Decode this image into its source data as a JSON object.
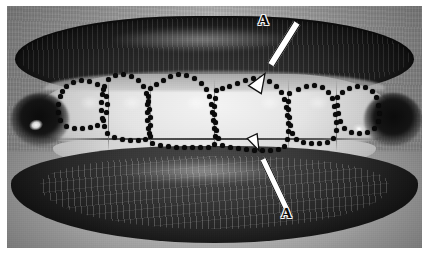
{
  "figure": {
    "kind": "clinical-photograph",
    "modality": "black-and-white intraoral smile photograph",
    "width_px": 429,
    "height_px": 260,
    "border_color": "#ffffff",
    "ink_color": "#0a0a0a"
  },
  "annotations": {
    "labels": [
      {
        "id": "label-a-upper",
        "text": "A",
        "x": 258,
        "y": 13,
        "description": "upper label A"
      },
      {
        "id": "label-a-lower",
        "text": "A",
        "x": 281,
        "y": 206,
        "description": "lower label A"
      }
    ],
    "arrows": [
      {
        "id": "arrow-upper",
        "style": "hollow-outline",
        "from_x": 297,
        "from_y": 22,
        "to_x": 265,
        "to_y": 73,
        "points_to": "incisal/cervical outline of maxillary right central incisor region",
        "direction": "down-left"
      },
      {
        "id": "arrow-lower",
        "style": "hollow-outline",
        "from_x": 286,
        "from_y": 207,
        "to_x": 259,
        "to_y": 150,
        "points_to": "incisal edge of maxillary left central incisor outline",
        "direction": "up-left"
      }
    ],
    "dotted_outlines": {
      "description": "Dotted black outlines tracing the clinical crown contours of six maxillary anterior teeth",
      "dot_color": "#0a0a0a",
      "dot_diameter_px": 5,
      "dot_spacing_px": 8,
      "teeth_outlined": 6,
      "paths": [
        {
          "name": "tooth-outline-1",
          "tooth": "maxillary right canine",
          "points": [
            [
              60,
              96
            ],
            [
              58,
              104
            ],
            [
              58,
              112
            ],
            [
              60,
              120
            ],
            [
              66,
              126
            ],
            [
              74,
              128
            ],
            [
              82,
              128
            ],
            [
              90,
              127
            ],
            [
              97,
              125
            ],
            [
              103,
              120
            ],
            [
              106,
              112
            ],
            [
              107,
              104
            ],
            [
              106,
              96
            ],
            [
              103,
              89
            ],
            [
              97,
              84
            ],
            [
              89,
              81
            ],
            [
              81,
              80
            ],
            [
              73,
              82
            ],
            [
              66,
              86
            ],
            [
              62,
              91
            ]
          ]
        },
        {
          "name": "tooth-outline-2",
          "tooth": "maxillary right lateral incisor",
          "points": [
            [
              104,
              86
            ],
            [
              102,
              94
            ],
            [
              101,
              102
            ],
            [
              101,
              110
            ],
            [
              102,
              118
            ],
            [
              104,
              126
            ],
            [
              107,
              133
            ],
            [
              114,
              137
            ],
            [
              122,
              139
            ],
            [
              130,
              140
            ],
            [
              138,
              140
            ],
            [
              145,
              139
            ],
            [
              149,
              133
            ],
            [
              150,
              125
            ],
            [
              150,
              117
            ],
            [
              149,
              109
            ],
            [
              148,
              101
            ],
            [
              146,
              93
            ],
            [
              143,
              86
            ],
            [
              138,
              80
            ],
            [
              131,
              76
            ],
            [
              123,
              74
            ],
            [
              115,
              75
            ],
            [
              108,
              79
            ]
          ]
        },
        {
          "name": "tooth-outline-3",
          "tooth": "maxillary right central incisor",
          "points": [
            [
              150,
              88
            ],
            [
              148,
              96
            ],
            [
              147,
              104
            ],
            [
              147,
              112
            ],
            [
              147,
              120
            ],
            [
              148,
              128
            ],
            [
              150,
              136
            ],
            [
              152,
              143
            ],
            [
              160,
              145
            ],
            [
              168,
              146
            ],
            [
              176,
              147
            ],
            [
              184,
              147
            ],
            [
              192,
              147
            ],
            [
              200,
              147
            ],
            [
              208,
              147
            ],
            [
              214,
              144
            ],
            [
              215,
              136
            ],
            [
              214,
              128
            ],
            [
              213,
              120
            ],
            [
              212,
              112
            ],
            [
              211,
              104
            ],
            [
              209,
              96
            ],
            [
              206,
              89
            ],
            [
              201,
              83
            ],
            [
              194,
              78
            ],
            [
              186,
              75
            ],
            [
              178,
              74
            ],
            [
              170,
              76
            ],
            [
              163,
              80
            ],
            [
              156,
              84
            ]
          ]
        },
        {
          "name": "tooth-outline-4",
          "tooth": "maxillary left central incisor",
          "points": [
            [
              216,
              90
            ],
            [
              215,
              98
            ],
            [
              214,
              106
            ],
            [
              214,
              114
            ],
            [
              215,
              122
            ],
            [
              216,
              130
            ],
            [
              218,
              138
            ],
            [
              222,
              145
            ],
            [
              230,
              147
            ],
            [
              238,
              148
            ],
            [
              246,
              149
            ],
            [
              254,
              150
            ],
            [
              262,
              150
            ],
            [
              270,
              150
            ],
            [
              278,
              149
            ],
            [
              284,
              146
            ],
            [
              287,
              139
            ],
            [
              288,
              131
            ],
            [
              288,
              123
            ],
            [
              287,
              115
            ],
            [
              286,
              107
            ],
            [
              284,
              99
            ],
            [
              281,
              92
            ],
            [
              276,
              86
            ],
            [
              269,
              81
            ],
            [
              261,
              78
            ],
            [
              253,
              78
            ],
            [
              245,
              80
            ],
            [
              237,
              83
            ],
            [
              229,
              86
            ],
            [
              222,
              88
            ]
          ]
        },
        {
          "name": "tooth-outline-5",
          "tooth": "maxillary left lateral incisor",
          "points": [
            [
              289,
              93
            ],
            [
              288,
              101
            ],
            [
              288,
              109
            ],
            [
              289,
              117
            ],
            [
              290,
              125
            ],
            [
              292,
              133
            ],
            [
              296,
              139
            ],
            [
              303,
              142
            ],
            [
              311,
              143
            ],
            [
              319,
              143
            ],
            [
              327,
              142
            ],
            [
              333,
              138
            ],
            [
              336,
              130
            ],
            [
              336,
              122
            ],
            [
              335,
              114
            ],
            [
              334,
              106
            ],
            [
              332,
              98
            ],
            [
              328,
              92
            ],
            [
              322,
              87
            ],
            [
              314,
              85
            ],
            [
              306,
              86
            ],
            [
              298,
              89
            ]
          ]
        },
        {
          "name": "tooth-outline-6",
          "tooth": "maxillary left canine",
          "points": [
            [
              337,
              97
            ],
            [
              337,
              105
            ],
            [
              338,
              113
            ],
            [
              340,
              121
            ],
            [
              344,
              128
            ],
            [
              351,
              132
            ],
            [
              359,
              133
            ],
            [
              367,
              132
            ],
            [
              374,
              128
            ],
            [
              378,
              121
            ],
            [
              379,
              113
            ],
            [
              378,
              105
            ],
            [
              376,
              97
            ],
            [
              372,
              91
            ],
            [
              365,
              87
            ],
            [
              357,
              86
            ],
            [
              349,
              88
            ],
            [
              342,
              92
            ]
          ]
        }
      ]
    }
  },
  "anatomy": {
    "structures": [
      {
        "name": "upper-lip",
        "shade": "dark"
      },
      {
        "name": "lower-lip",
        "shade": "dark"
      },
      {
        "name": "maxillary-teeth",
        "shade": "bright"
      },
      {
        "name": "mandibular-teeth",
        "shade": "light-grey"
      },
      {
        "name": "left-commissure",
        "shade": "black"
      },
      {
        "name": "right-commissure",
        "shade": "black"
      },
      {
        "name": "chin-skin",
        "shade": "mid-grey"
      }
    ],
    "tooth_separations_x": [
      108,
      150,
      214,
      288,
      336
    ],
    "highlights": [
      {
        "name": "left-commissure-reflection",
        "x": 20,
        "y": 112
      },
      {
        "name": "right-commissure-reflection",
        "x": 343,
        "y": 116
      }
    ]
  },
  "colors": {
    "ink": "#0a0a0a",
    "paper": "#ffffff",
    "enamel_high": "#f2f2f2",
    "enamel_mid": "#d2d2d2",
    "lip_dark": "#1e1e1e",
    "skin_mid": "#a6a6a6"
  }
}
